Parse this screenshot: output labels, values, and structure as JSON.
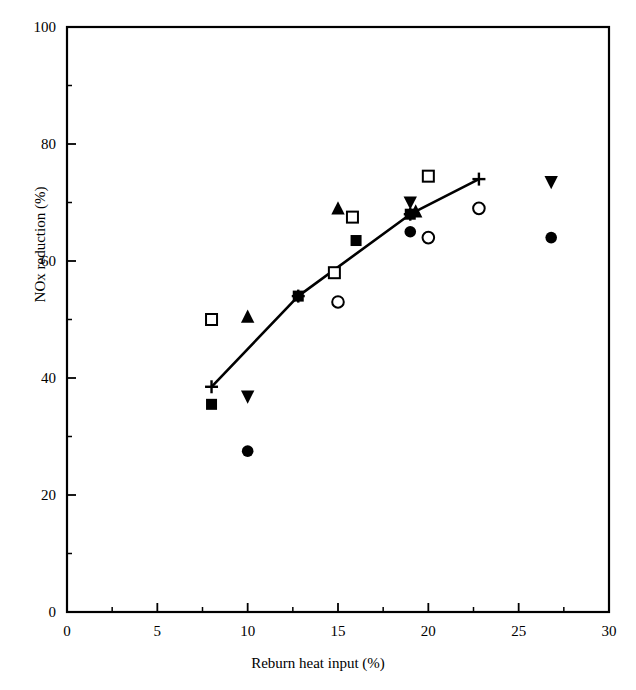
{
  "chart_data": {
    "type": "scatter",
    "title": "",
    "xlabel": "Reburn heat input (%)",
    "ylabel": "NOx reduction (%)",
    "xlim": [
      0,
      30
    ],
    "ylim": [
      0,
      100
    ],
    "xticks": [
      0,
      5,
      10,
      15,
      20,
      25,
      30
    ],
    "yticks": [
      0,
      20,
      40,
      60,
      80,
      100
    ],
    "xtick_labels": [
      "0",
      "5",
      "10",
      "15",
      "20",
      "25",
      "30"
    ],
    "ytick_labels": [
      "0",
      "20",
      "40",
      "60",
      "80",
      "100"
    ],
    "minor_tick_interval_x": 2.5,
    "minor_tick_interval_y": 10,
    "grid": false,
    "legend": "none",
    "series": [
      {
        "name": "plus-line",
        "marker": "plus",
        "connected": true,
        "points": [
          {
            "x": 8.0,
            "y": 38.5
          },
          {
            "x": 12.8,
            "y": 54.0
          },
          {
            "x": 19.0,
            "y": 68.0
          },
          {
            "x": 22.8,
            "y": 74.0
          }
        ]
      },
      {
        "name": "filled-square",
        "marker": "filled-square",
        "connected": false,
        "points": [
          {
            "x": 8.0,
            "y": 35.5
          },
          {
            "x": 12.8,
            "y": 54.0
          },
          {
            "x": 16.0,
            "y": 63.5
          },
          {
            "x": 19.0,
            "y": 68.0
          }
        ]
      },
      {
        "name": "open-square",
        "marker": "open-square",
        "connected": false,
        "points": [
          {
            "x": 8.0,
            "y": 50.0
          },
          {
            "x": 14.8,
            "y": 58.0
          },
          {
            "x": 15.8,
            "y": 67.5
          },
          {
            "x": 20.0,
            "y": 74.5
          }
        ]
      },
      {
        "name": "filled-triangle-up",
        "marker": "filled-triangle-up",
        "connected": false,
        "points": [
          {
            "x": 10.0,
            "y": 50.5
          },
          {
            "x": 15.0,
            "y": 69.0
          },
          {
            "x": 19.3,
            "y": 68.5
          }
        ]
      },
      {
        "name": "filled-triangle-down",
        "marker": "filled-triangle-down",
        "connected": false,
        "points": [
          {
            "x": 10.0,
            "y": 36.8
          },
          {
            "x": 19.0,
            "y": 70.0
          },
          {
            "x": 26.8,
            "y": 73.5
          }
        ]
      },
      {
        "name": "filled-circle",
        "marker": "filled-circle",
        "connected": false,
        "points": [
          {
            "x": 10.0,
            "y": 27.5
          },
          {
            "x": 19.0,
            "y": 65.0
          },
          {
            "x": 26.8,
            "y": 64.0
          }
        ]
      },
      {
        "name": "open-circle",
        "marker": "open-circle",
        "connected": false,
        "points": [
          {
            "x": 15.0,
            "y": 53.0
          },
          {
            "x": 20.0,
            "y": 64.0
          },
          {
            "x": 22.8,
            "y": 69.0
          }
        ]
      }
    ]
  },
  "axes": {
    "x_axis_label": "Reburn heat input (%)",
    "y_axis_label": "NOx reduction (%)"
  },
  "colors": {
    "ink": "#000000",
    "background": "#ffffff"
  }
}
